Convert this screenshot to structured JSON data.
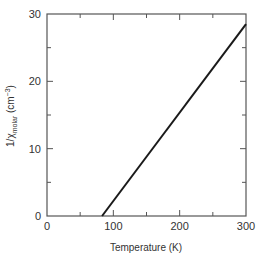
{
  "chart_data": {
    "type": "line",
    "title": "",
    "xlabel": "Temperature (K)",
    "ylabel": "1/χmolar (cm−3)",
    "ylabel_parts": {
      "prefix": "1/χ",
      "subscript": "molar",
      "units": " (cm",
      "exponent": "−3",
      "close": ")"
    },
    "xlim": [
      0,
      300
    ],
    "ylim": [
      0,
      30
    ],
    "x_major_ticks": [
      0,
      100,
      200,
      300
    ],
    "x_minor_ticks": [
      50,
      150,
      250
    ],
    "y_major_ticks": [
      0,
      10,
      20,
      30
    ],
    "y_minor_ticks": [
      5,
      15,
      25
    ],
    "grid": false,
    "legend": null,
    "series": [
      {
        "name": "inverse molar susceptibility",
        "color": "#1a1a1a",
        "x": [
          83,
          300
        ],
        "y": [
          0,
          28.5
        ]
      }
    ]
  },
  "colors": {
    "axis": "#555555",
    "line": "#1a1a1a",
    "background": "#ffffff"
  }
}
